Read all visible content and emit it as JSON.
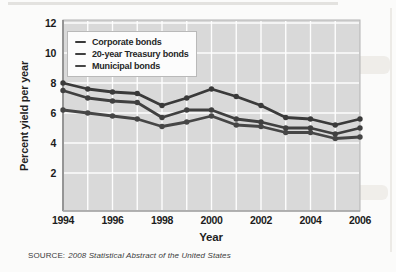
{
  "page": {
    "source_prefix": "SOURCE:",
    "source_title": "2008 Statistical Abstract of the United States"
  },
  "chart_data": {
    "type": "line",
    "title": "",
    "xlabel": "Year",
    "ylabel": "Percent yield per year",
    "x": [
      1994,
      1995,
      1996,
      1997,
      1998,
      1999,
      2000,
      2001,
      2002,
      2003,
      2004,
      2005,
      2006
    ],
    "x_tick_labels": [
      "1994",
      "1996",
      "1998",
      "2000",
      "2002",
      "2004",
      "2006"
    ],
    "x_tick_years": [
      1994,
      1996,
      1998,
      2000,
      2002,
      2004,
      2006
    ],
    "y_ticks": [
      2,
      4,
      6,
      8,
      10,
      12
    ],
    "y_tick_labels": [
      "2",
      "4",
      "6",
      "8",
      "10",
      "12"
    ],
    "ylim": [
      0,
      12.2
    ],
    "grid": true,
    "legend_position": "top-left",
    "plot_bg_color": "#d9d9d9",
    "grid_color": "#ffffff",
    "axis_color": "#8f8f8f",
    "series": [
      {
        "name": "Corporate bonds",
        "color": "#3a3a3a",
        "values": [
          8.0,
          7.6,
          7.4,
          7.3,
          6.5,
          7.0,
          7.6,
          7.1,
          6.5,
          5.7,
          5.6,
          5.2,
          5.6
        ]
      },
      {
        "name": "20-year Treasury bonds",
        "color": "#404040",
        "values": [
          7.5,
          7.0,
          6.8,
          6.7,
          5.7,
          6.2,
          6.2,
          5.6,
          5.4,
          5.0,
          5.0,
          4.6,
          5.0
        ]
      },
      {
        "name": "Municipal bonds",
        "color": "#464646",
        "values": [
          6.2,
          6.0,
          5.8,
          5.6,
          5.1,
          5.4,
          5.8,
          5.2,
          5.1,
          4.7,
          4.7,
          4.3,
          4.4
        ]
      }
    ]
  }
}
